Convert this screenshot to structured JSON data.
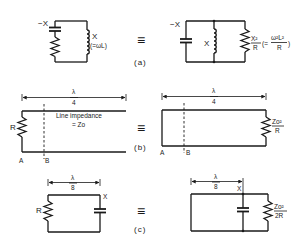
{
  "figure": {
    "equivalence_symbol": "≡",
    "panels": [
      {
        "id": "a",
        "caption": "(a)",
        "left": {
          "capacitor_label": "−X",
          "inductor_label": "X",
          "inductor_note": "(=ωL)"
        },
        "right": {
          "capacitor_label": "−X",
          "inductor_label": "X",
          "resistor_label_num": "X²",
          "resistor_label_den": "R",
          "resistor_note_prefix": "(=",
          "resistor_note_num": "ω²L²",
          "resistor_note_den": "R",
          "resistor_note_suffix": ")"
        }
      },
      {
        "id": "b",
        "caption": "(b)",
        "left": {
          "length_num": "λ",
          "length_den": "4",
          "resistor_label": "R",
          "line_label_1": "Line impedance",
          "line_label_2": "= Zo",
          "point_a": "A",
          "point_b": "B"
        },
        "right": {
          "length_num": "λ",
          "length_den": "4",
          "resistor_label_num": "Zo²",
          "resistor_label_den": "R",
          "point_a": "A",
          "point_b": "B"
        }
      },
      {
        "id": "c",
        "caption": "(c)",
        "left": {
          "length_num": "λ",
          "length_den": "8",
          "resistor_label": "R",
          "capacitor_label": "X"
        },
        "right": {
          "length_num": "λ",
          "length_den": "8",
          "capacitor_label": "X",
          "resistor_label_num": "Zo²",
          "resistor_label_den": "2R"
        }
      }
    ]
  }
}
